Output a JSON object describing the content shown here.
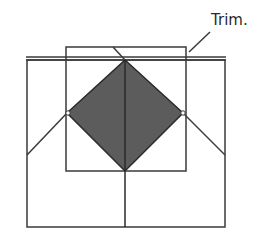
{
  "diagram": {
    "label": "Trim.",
    "colors": {
      "line": "#3a3a3a",
      "fill": "#5c5c5c",
      "background": "#ffffff"
    },
    "shapes": {
      "outer_square": {
        "x": 27,
        "y": 60,
        "w": 198,
        "h": 167
      },
      "top_double_line": {
        "x1": 26,
        "x2": 226,
        "y_a": 57,
        "y_b": 60
      },
      "inner_square": {
        "x": 66,
        "y": 47,
        "w": 120,
        "h": 124
      },
      "diamond": {
        "top": [
          125,
          60
        ],
        "right": [
          183,
          113
        ],
        "bottom": [
          125,
          171
        ],
        "left": [
          67,
          113
        ]
      },
      "center_line": {
        "x": 125,
        "y1": 60,
        "y2": 227
      },
      "left_diagonal": {
        "x1": 67,
        "y1": 113,
        "x2": 27,
        "y2": 155
      },
      "right_diagonal": {
        "x1": 183,
        "y1": 113,
        "x2": 225,
        "y2": 155
      },
      "trim_slash": {
        "x1": 113,
        "y1": 47,
        "x2": 125,
        "y2": 60
      },
      "leader_line": {
        "x1": 189,
        "y1": 52,
        "x2": 210,
        "y2": 32
      }
    }
  }
}
